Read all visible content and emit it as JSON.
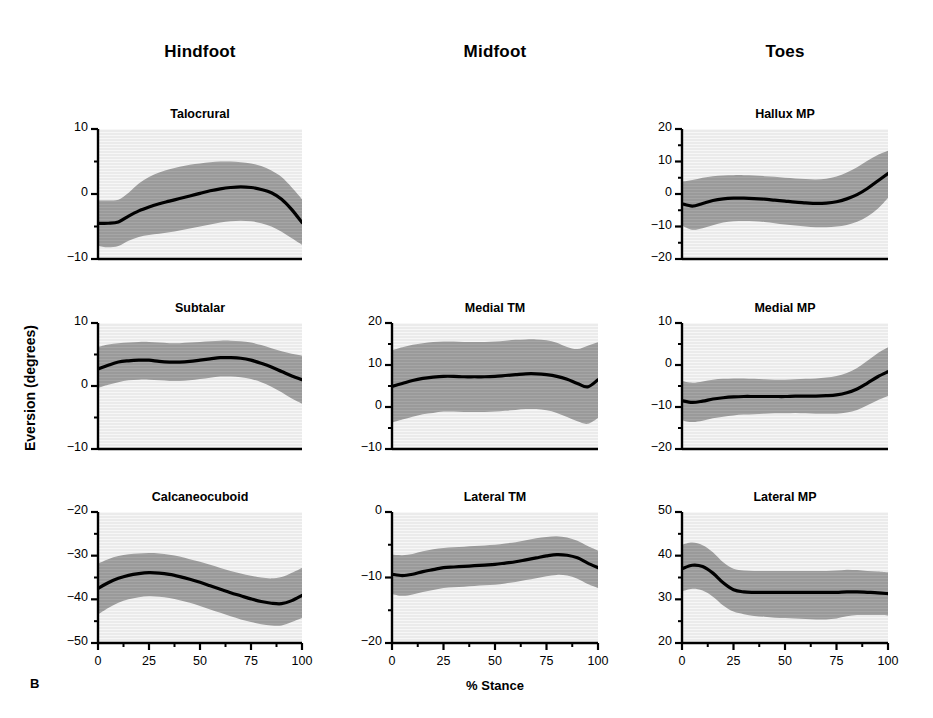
{
  "figure": {
    "panel_letter": "B",
    "ylabel": "Eversion (degrees)",
    "xlabel": "% Stance",
    "columns": [
      "Hindfoot",
      "Midfoot",
      "Toes"
    ],
    "band_color": "#9a9a9a",
    "plot_bg_color": "#ebebeb",
    "line_color": "#000000"
  },
  "chart_data": [
    {
      "type": "area",
      "title": "Talocrural",
      "column": "Hindfoot",
      "row": 1,
      "xlabel": "% Stance",
      "ylabel": "Eversion (degrees)",
      "xlim": [
        0,
        100
      ],
      "ylim": [
        -10,
        10
      ],
      "xticks": [
        0,
        25,
        50,
        75,
        100
      ],
      "yticks": [
        10,
        0,
        -10
      ],
      "yminor": [
        5,
        -5
      ],
      "grid": false,
      "legend": "none",
      "x": [
        0,
        5,
        10,
        15,
        20,
        25,
        30,
        35,
        40,
        45,
        50,
        55,
        60,
        65,
        70,
        75,
        80,
        85,
        90,
        95,
        100
      ],
      "mean": [
        -4.5,
        -4.5,
        -4.3,
        -3.4,
        -2.6,
        -2.0,
        -1.5,
        -1.1,
        -0.7,
        -0.3,
        0.1,
        0.5,
        0.8,
        1.0,
        1.1,
        1.0,
        0.7,
        0.2,
        -0.8,
        -2.4,
        -4.4
      ],
      "upper": [
        -1.0,
        -1.0,
        -0.9,
        0.2,
        1.6,
        2.6,
        3.3,
        3.8,
        4.2,
        4.5,
        4.7,
        4.9,
        5.0,
        5.0,
        4.9,
        4.7,
        4.3,
        3.6,
        2.6,
        1.0,
        -0.8
      ],
      "lower": [
        -8.0,
        -8.2,
        -8.0,
        -7.2,
        -6.6,
        -6.3,
        -6.1,
        -5.9,
        -5.6,
        -5.3,
        -5.0,
        -4.7,
        -4.4,
        -4.2,
        -4.1,
        -4.2,
        -4.5,
        -5.0,
        -5.8,
        -6.8,
        -7.8
      ]
    },
    {
      "type": "area",
      "title": "Subtalar",
      "column": "Hindfoot",
      "row": 2,
      "xlabel": "% Stance",
      "ylabel": "Eversion (degrees)",
      "xlim": [
        0,
        100
      ],
      "ylim": [
        -10,
        10
      ],
      "xticks": [
        0,
        25,
        50,
        75,
        100
      ],
      "yticks": [
        10,
        0,
        -10
      ],
      "yminor": [
        5,
        -5
      ],
      "grid": false,
      "legend": "none",
      "x": [
        0,
        5,
        10,
        15,
        20,
        25,
        30,
        35,
        40,
        45,
        50,
        55,
        60,
        65,
        70,
        75,
        80,
        85,
        90,
        95,
        100
      ],
      "mean": [
        2.7,
        3.3,
        3.8,
        4.0,
        4.1,
        4.1,
        3.9,
        3.8,
        3.8,
        3.9,
        4.1,
        4.3,
        4.5,
        4.5,
        4.4,
        4.1,
        3.6,
        3.0,
        2.3,
        1.6,
        1.0
      ],
      "upper": [
        6.2,
        6.6,
        6.8,
        6.9,
        7.0,
        7.0,
        6.9,
        6.8,
        6.8,
        6.9,
        7.0,
        7.1,
        7.2,
        7.2,
        7.1,
        6.9,
        6.5,
        6.0,
        5.5,
        5.1,
        4.8
      ],
      "lower": [
        -0.3,
        0.2,
        0.6,
        0.9,
        1.0,
        1.0,
        0.9,
        0.8,
        0.8,
        0.9,
        1.1,
        1.3,
        1.5,
        1.5,
        1.4,
        1.1,
        0.6,
        -0.1,
        -1.0,
        -2.0,
        -2.8
      ]
    },
    {
      "type": "area",
      "title": "Calcaneocuboid",
      "column": "Hindfoot",
      "row": 3,
      "xlabel": "% Stance",
      "ylabel": "Eversion (degrees)",
      "xlim": [
        0,
        100
      ],
      "ylim": [
        -50,
        -20
      ],
      "xticks": [
        0,
        25,
        50,
        75,
        100
      ],
      "yticks": [
        -20,
        -30,
        -40,
        -50
      ],
      "yminor": [
        -25,
        -35,
        -45
      ],
      "grid": false,
      "legend": "none",
      "x": [
        0,
        5,
        10,
        15,
        20,
        25,
        30,
        35,
        40,
        45,
        50,
        55,
        60,
        65,
        70,
        75,
        80,
        85,
        90,
        95,
        100
      ],
      "mean": [
        -37.5,
        -36.2,
        -35.2,
        -34.5,
        -34.1,
        -33.9,
        -34.0,
        -34.3,
        -34.8,
        -35.4,
        -36.1,
        -36.9,
        -37.7,
        -38.5,
        -39.2,
        -39.9,
        -40.5,
        -40.9,
        -41.0,
        -40.3,
        -39.1
      ],
      "upper": [
        -31.8,
        -30.8,
        -30.1,
        -29.7,
        -29.5,
        -29.4,
        -29.5,
        -29.8,
        -30.2,
        -30.8,
        -31.4,
        -32.1,
        -32.8,
        -33.5,
        -34.1,
        -34.6,
        -35.0,
        -35.2,
        -34.9,
        -33.9,
        -32.8
      ],
      "lower": [
        -43.5,
        -42.0,
        -40.8,
        -40.0,
        -39.5,
        -39.3,
        -39.4,
        -39.7,
        -40.2,
        -40.8,
        -41.5,
        -42.3,
        -43.1,
        -43.9,
        -44.6,
        -45.2,
        -45.7,
        -46.0,
        -46.0,
        -45.2,
        -44.3
      ]
    },
    {
      "type": "area",
      "title": "Medial TM",
      "column": "Midfoot",
      "row": 2,
      "xlabel": "% Stance",
      "ylabel": "Eversion (degrees)",
      "xlim": [
        0,
        100
      ],
      "ylim": [
        -10,
        20
      ],
      "xticks": [
        0,
        25,
        50,
        75,
        100
      ],
      "yticks": [
        20,
        10,
        0,
        -10
      ],
      "yminor": [
        15,
        5,
        -5
      ],
      "grid": false,
      "legend": "none",
      "x": [
        0,
        5,
        10,
        15,
        20,
        25,
        30,
        35,
        40,
        45,
        50,
        55,
        60,
        65,
        70,
        75,
        80,
        85,
        90,
        95,
        100
      ],
      "mean": [
        4.9,
        5.6,
        6.3,
        6.8,
        7.1,
        7.3,
        7.3,
        7.2,
        7.2,
        7.2,
        7.3,
        7.5,
        7.7,
        7.9,
        7.9,
        7.7,
        7.3,
        6.6,
        5.6,
        4.8,
        6.5
      ],
      "upper": [
        13.5,
        14.2,
        14.8,
        15.2,
        15.5,
        15.6,
        15.6,
        15.5,
        15.5,
        15.5,
        15.6,
        15.8,
        16.0,
        16.1,
        16.1,
        15.9,
        15.3,
        14.3,
        13.8,
        14.6,
        15.4
      ],
      "lower": [
        -3.7,
        -3.0,
        -2.3,
        -1.7,
        -1.4,
        -1.1,
        -1.1,
        -1.2,
        -1.2,
        -1.2,
        -1.1,
        -0.9,
        -0.7,
        -0.5,
        -0.5,
        -0.8,
        -1.4,
        -2.4,
        -3.4,
        -4.0,
        -2.6
      ]
    },
    {
      "type": "area",
      "title": "Lateral TM",
      "column": "Midfoot",
      "row": 3,
      "xlabel": "% Stance",
      "ylabel": "Eversion (degrees)",
      "xlim": [
        0,
        100
      ],
      "ylim": [
        -20,
        0
      ],
      "xticks": [
        0,
        25,
        50,
        75,
        100
      ],
      "yticks": [
        0,
        -10,
        -20
      ],
      "yminor": [
        -5,
        -15
      ],
      "grid": false,
      "legend": "none",
      "x": [
        0,
        5,
        10,
        15,
        20,
        25,
        30,
        35,
        40,
        45,
        50,
        55,
        60,
        65,
        70,
        75,
        80,
        85,
        90,
        95,
        100
      ],
      "mean": [
        -9.5,
        -9.7,
        -9.5,
        -9.1,
        -8.8,
        -8.5,
        -8.4,
        -8.3,
        -8.2,
        -8.1,
        -8.0,
        -7.8,
        -7.6,
        -7.3,
        -7.0,
        -6.7,
        -6.5,
        -6.6,
        -7.0,
        -7.8,
        -8.5
      ],
      "upper": [
        -6.5,
        -6.6,
        -6.4,
        -6.0,
        -5.7,
        -5.5,
        -5.4,
        -5.3,
        -5.2,
        -5.1,
        -5.0,
        -4.8,
        -4.6,
        -4.3,
        -4.0,
        -3.8,
        -3.7,
        -3.9,
        -4.4,
        -5.2,
        -5.9
      ],
      "lower": [
        -12.5,
        -12.8,
        -12.6,
        -12.2,
        -11.9,
        -11.6,
        -11.5,
        -11.4,
        -11.3,
        -11.2,
        -11.1,
        -10.9,
        -10.7,
        -10.4,
        -10.1,
        -9.8,
        -9.6,
        -9.7,
        -10.2,
        -11.0,
        -11.6
      ]
    },
    {
      "type": "area",
      "title": "Hallux MP",
      "column": "Toes",
      "row": 1,
      "xlabel": "% Stance",
      "ylabel": "Eversion (degrees)",
      "xlim": [
        0,
        100
      ],
      "ylim": [
        -20,
        20
      ],
      "xticks": [
        0,
        25,
        50,
        75,
        100
      ],
      "yticks": [
        20,
        10,
        0,
        -10,
        -20
      ],
      "yminor": [
        15,
        5,
        -5,
        -15
      ],
      "grid": false,
      "legend": "none",
      "x": [
        0,
        5,
        10,
        15,
        20,
        25,
        30,
        35,
        40,
        45,
        50,
        55,
        60,
        65,
        70,
        75,
        80,
        85,
        90,
        95,
        100
      ],
      "mean": [
        -3.0,
        -3.7,
        -2.9,
        -2.0,
        -1.5,
        -1.3,
        -1.3,
        -1.4,
        -1.6,
        -1.9,
        -2.2,
        -2.5,
        -2.7,
        -2.9,
        -2.8,
        -2.4,
        -1.5,
        -0.2,
        1.7,
        4.0,
        6.3
      ],
      "upper": [
        3.8,
        4.3,
        5.0,
        5.5,
        5.7,
        5.8,
        5.8,
        5.7,
        5.5,
        5.3,
        5.0,
        4.8,
        4.6,
        4.5,
        4.7,
        5.4,
        6.6,
        8.2,
        10.2,
        12.0,
        13.3
      ],
      "lower": [
        -9.8,
        -11.0,
        -10.5,
        -9.6,
        -8.8,
        -8.4,
        -8.3,
        -8.4,
        -8.6,
        -9.0,
        -9.4,
        -9.7,
        -10.0,
        -10.2,
        -10.2,
        -10.0,
        -9.5,
        -8.5,
        -6.9,
        -4.5,
        -1.2
      ]
    },
    {
      "type": "area",
      "title": "Medial MP",
      "column": "Toes",
      "row": 2,
      "xlabel": "% Stance",
      "ylabel": "Eversion (degrees)",
      "xlim": [
        0,
        100
      ],
      "ylim": [
        -20,
        10
      ],
      "xticks": [
        0,
        25,
        50,
        75,
        100
      ],
      "yticks": [
        10,
        0,
        -10,
        -20
      ],
      "yminor": [
        5,
        -5,
        -15
      ],
      "grid": false,
      "legend": "none",
      "x": [
        0,
        5,
        10,
        15,
        20,
        25,
        30,
        35,
        40,
        45,
        50,
        55,
        60,
        65,
        70,
        75,
        80,
        85,
        90,
        95,
        100
      ],
      "mean": [
        -8.5,
        -8.9,
        -8.6,
        -8.1,
        -7.8,
        -7.6,
        -7.5,
        -7.5,
        -7.5,
        -7.5,
        -7.5,
        -7.4,
        -7.4,
        -7.4,
        -7.3,
        -7.1,
        -6.6,
        -5.7,
        -4.3,
        -2.8,
        -1.6
      ],
      "upper": [
        -3.8,
        -4.2,
        -3.9,
        -3.5,
        -3.3,
        -3.2,
        -3.2,
        -3.3,
        -3.4,
        -3.5,
        -3.5,
        -3.4,
        -3.3,
        -3.2,
        -3.0,
        -2.6,
        -1.9,
        -0.7,
        1.0,
        2.8,
        4.2
      ],
      "lower": [
        -13.2,
        -13.6,
        -13.3,
        -12.7,
        -12.3,
        -12.0,
        -11.8,
        -11.7,
        -11.6,
        -11.5,
        -11.5,
        -11.4,
        -11.5,
        -11.6,
        -11.6,
        -11.6,
        -11.3,
        -10.7,
        -9.6,
        -8.4,
        -7.4
      ]
    },
    {
      "type": "area",
      "title": "Lateral MP",
      "column": "Toes",
      "row": 3,
      "xlabel": "% Stance",
      "ylabel": "Eversion (degrees)",
      "xlim": [
        0,
        100
      ],
      "ylim": [
        20,
        50
      ],
      "xticks": [
        0,
        25,
        50,
        75,
        100
      ],
      "yticks": [
        50,
        40,
        30,
        20
      ],
      "yminor": [
        45,
        35,
        25
      ],
      "grid": false,
      "legend": "none",
      "x": [
        0,
        5,
        10,
        15,
        20,
        25,
        30,
        35,
        40,
        45,
        50,
        55,
        60,
        65,
        70,
        75,
        80,
        85,
        90,
        95,
        100
      ],
      "mean": [
        37.0,
        37.8,
        37.5,
        36.0,
        33.8,
        32.2,
        31.7,
        31.6,
        31.6,
        31.6,
        31.6,
        31.6,
        31.6,
        31.6,
        31.6,
        31.6,
        31.7,
        31.7,
        31.6,
        31.5,
        31.3
      ],
      "upper": [
        42.5,
        43.0,
        42.4,
        40.8,
        38.5,
        37.0,
        36.6,
        36.5,
        36.5,
        36.5,
        36.5,
        36.5,
        36.5,
        36.5,
        36.5,
        36.6,
        36.8,
        36.7,
        36.5,
        36.4,
        36.2
      ],
      "lower": [
        31.8,
        32.4,
        32.0,
        30.6,
        28.6,
        27.2,
        26.6,
        26.2,
        26.0,
        25.8,
        25.7,
        25.6,
        25.5,
        25.4,
        25.4,
        25.6,
        26.1,
        26.4,
        26.4,
        26.4,
        26.3
      ]
    }
  ]
}
